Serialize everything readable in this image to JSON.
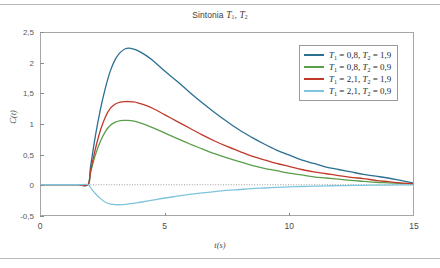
{
  "chart_data": {
    "type": "line",
    "title_parts": {
      "prefix": "Sintonia ",
      "var1": "T",
      "sub1": "1",
      "sep": ", ",
      "var2": "T",
      "sub2": "2"
    },
    "xlabel": "t(s)",
    "ylabel": "C(t)",
    "xlim": [
      0,
      15
    ],
    "ylim": [
      -0.5,
      2.5
    ],
    "xticks": [
      0,
      5,
      10,
      15
    ],
    "xtick_labels": [
      "0",
      "5",
      "10",
      "15"
    ],
    "yticks": [
      -0.5,
      0,
      0.5,
      1,
      1.5,
      2,
      2.5
    ],
    "ytick_labels": [
      "-0,5",
      "0",
      "0,5",
      "1",
      "1,5",
      "2",
      "2,5"
    ],
    "grid": false,
    "zero_line": true,
    "zero_line_style": "dotted",
    "legend_position": "upper right",
    "dead_time": 1.9,
    "series": [
      {
        "name": "T₁ = 0,8, T₂ = 1,9",
        "color": "#2b6f91",
        "peak_value": 2.25,
        "peak_time": 3.55,
        "final_value": 0.03,
        "params": {
          "T1": 0.8,
          "T2": 1.9
        },
        "x": [
          0,
          0.5,
          1,
          1.5,
          1.9,
          2.0,
          2.2,
          2.4,
          2.6,
          2.8,
          3.0,
          3.2,
          3.4,
          3.55,
          3.7,
          3.9,
          4.2,
          4.5,
          5.0,
          5.5,
          6.0,
          6.5,
          7.0,
          7.5,
          8.0,
          8.5,
          9.0,
          9.5,
          10.0,
          10.5,
          11.0,
          11.5,
          12.0,
          12.5,
          13.0,
          13.5,
          14.0,
          14.5,
          15.0
        ],
        "y": [
          0,
          0,
          0,
          0,
          0,
          0.3,
          0.82,
          1.25,
          1.6,
          1.88,
          2.07,
          2.18,
          2.24,
          2.25,
          2.24,
          2.21,
          2.14,
          2.05,
          1.87,
          1.7,
          1.52,
          1.35,
          1.19,
          1.04,
          0.9,
          0.78,
          0.67,
          0.57,
          0.49,
          0.41,
          0.35,
          0.29,
          0.25,
          0.21,
          0.17,
          0.14,
          0.11,
          0.07,
          0.03
        ]
      },
      {
        "name": "T₁ = 0,8, T₂ = 0,9",
        "color": "#5a9e4a",
        "peak_value": 1.06,
        "peak_time": 3.5,
        "final_value": 0.01,
        "params": {
          "T1": 0.8,
          "T2": 0.9
        },
        "x": [
          0,
          0.5,
          1,
          1.5,
          1.9,
          2.0,
          2.2,
          2.4,
          2.6,
          2.8,
          3.0,
          3.2,
          3.4,
          3.5,
          3.7,
          3.9,
          4.2,
          4.5,
          5.0,
          5.5,
          6.0,
          6.5,
          7.0,
          7.5,
          8.0,
          8.5,
          9.0,
          9.5,
          10.0,
          10.5,
          11.0,
          11.5,
          12.0,
          12.5,
          13.0,
          13.5,
          14.0,
          14.5,
          15.0
        ],
        "y": [
          0,
          0,
          0,
          0,
          0,
          0.2,
          0.5,
          0.72,
          0.88,
          0.98,
          1.03,
          1.055,
          1.06,
          1.06,
          1.05,
          1.03,
          0.99,
          0.94,
          0.85,
          0.76,
          0.67,
          0.59,
          0.51,
          0.44,
          0.38,
          0.32,
          0.27,
          0.23,
          0.19,
          0.16,
          0.13,
          0.11,
          0.09,
          0.07,
          0.055,
          0.04,
          0.03,
          0.02,
          0.01
        ]
      },
      {
        "name": "T₁ = 2,1, T₂ = 1,9",
        "color": "#c0392b",
        "peak_value": 1.37,
        "peak_time": 3.55,
        "final_value": 0.015,
        "params": {
          "T1": 2.1,
          "T2": 1.9
        },
        "x": [
          0,
          0.5,
          1,
          1.5,
          1.9,
          2.0,
          2.2,
          2.4,
          2.6,
          2.8,
          3.0,
          3.2,
          3.4,
          3.55,
          3.7,
          3.9,
          4.2,
          4.5,
          5.0,
          5.5,
          6.0,
          6.5,
          7.0,
          7.5,
          8.0,
          8.5,
          9.0,
          9.5,
          10.0,
          10.5,
          11.0,
          11.5,
          12.0,
          12.5,
          13.0,
          13.5,
          14.0,
          14.5,
          15.0
        ],
        "y": [
          0,
          0,
          0,
          0,
          0,
          0.23,
          0.6,
          0.9,
          1.12,
          1.26,
          1.33,
          1.36,
          1.37,
          1.37,
          1.365,
          1.35,
          1.31,
          1.26,
          1.15,
          1.04,
          0.93,
          0.82,
          0.72,
          0.63,
          0.55,
          0.47,
          0.41,
          0.35,
          0.3,
          0.25,
          0.21,
          0.18,
          0.15,
          0.12,
          0.1,
          0.07,
          0.05,
          0.03,
          0.015
        ]
      },
      {
        "name": "T₁ = 2,1, T₂ = 0,9",
        "color": "#7fc4dd",
        "peak_value": -0.33,
        "peak_time": 3.0,
        "final_value": 0.0,
        "params": {
          "T1": 2.1,
          "T2": 0.9
        },
        "x": [
          0,
          0.5,
          1,
          1.5,
          1.9,
          2.0,
          2.2,
          2.4,
          2.6,
          2.8,
          3.0,
          3.2,
          3.4,
          3.7,
          4.0,
          4.5,
          5.0,
          5.5,
          6.0,
          6.5,
          7.0,
          7.5,
          8.0,
          8.5,
          9.0,
          9.5,
          10.0,
          10.5,
          11.0,
          11.5,
          12.0,
          12.5,
          13.0,
          13.5,
          14.0,
          14.5,
          15.0
        ],
        "y": [
          0,
          0,
          0,
          0,
          0,
          -0.05,
          -0.15,
          -0.23,
          -0.29,
          -0.32,
          -0.33,
          -0.33,
          -0.325,
          -0.31,
          -0.29,
          -0.255,
          -0.22,
          -0.19,
          -0.16,
          -0.135,
          -0.115,
          -0.095,
          -0.08,
          -0.065,
          -0.055,
          -0.045,
          -0.037,
          -0.03,
          -0.025,
          -0.02,
          -0.016,
          -0.013,
          -0.01,
          -0.008,
          -0.006,
          -0.004,
          -0.002
        ]
      }
    ]
  },
  "legend": [
    {
      "label_html": "T₁ = 0,8, T₂ = 1,9",
      "t1": "0,8",
      "t2": "1,9",
      "color": "#2b6f91"
    },
    {
      "label_html": "T₁ = 0,8, T₂ = 0,9",
      "t1": "0,8",
      "t2": "0,9",
      "color": "#5a9e4a"
    },
    {
      "label_html": "T₁ = 2,1, T₂ = 1,9",
      "t1": "2,1",
      "t2": "1,9",
      "color": "#c0392b"
    },
    {
      "label_html": "T₁ = 2,1, T₂ = 0,9",
      "t1": "2,1",
      "t2": "0,9",
      "color": "#7fc4dd"
    }
  ],
  "colors": {
    "axis": "#a6a6a6",
    "tick_text": "#5a5a5a",
    "title_text": "#3c3c3c",
    "page_rule": "#b9b9b9",
    "zero_line": "#9a9a9a",
    "background": "#ffffff"
  }
}
